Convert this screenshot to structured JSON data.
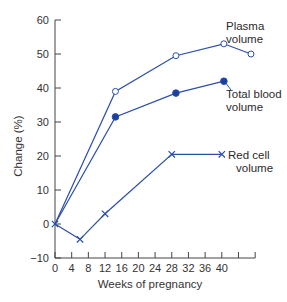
{
  "colors": {
    "series": "#2a4fa8",
    "plasma_fill": "#ffffff",
    "total_fill": "#1a3fa0",
    "axis": "#444444",
    "text": "#333333"
  },
  "chart_data": {
    "type": "line",
    "title": "",
    "xlabel": "Weeks of pregnancy",
    "ylabel": "Change (%)",
    "xlim": [
      0,
      48
    ],
    "ylim": [
      -10,
      60
    ],
    "xticks": [
      0,
      4,
      8,
      12,
      16,
      20,
      24,
      28,
      32,
      36,
      40,
      44,
      48
    ],
    "xtick_labels": [
      "0",
      "4",
      "8",
      "12",
      "16",
      "20",
      "24",
      "28",
      "32",
      "36",
      "40"
    ],
    "yticks": [
      -10,
      0,
      10,
      20,
      30,
      40,
      50,
      60
    ],
    "ytick_labels": [
      "−10",
      "0",
      "10",
      "20",
      "30",
      "40",
      "50",
      "60"
    ],
    "grid": false,
    "legend": "inline labels at line ends",
    "series": [
      {
        "name": "Plasma volume",
        "label_lines": [
          "Plasma",
          "volume"
        ],
        "marker": "open-circle",
        "x": [
          0,
          14.5,
          29,
          40.5,
          47
        ],
        "y": [
          0,
          39,
          49.5,
          53,
          50
        ]
      },
      {
        "name": "Total blood volume",
        "label_lines": [
          "Total blood",
          "volume"
        ],
        "marker": "filled-circle",
        "x": [
          0,
          14.5,
          29,
          40.5
        ],
        "y": [
          0,
          31.5,
          38.5,
          42
        ]
      },
      {
        "name": "Red cell volume",
        "label_lines": [
          "Red cell",
          "volume"
        ],
        "marker": "x",
        "x": [
          0,
          6,
          12,
          28,
          40
        ],
        "y": [
          0,
          -4.5,
          3,
          20.5,
          20.5
        ]
      }
    ]
  }
}
